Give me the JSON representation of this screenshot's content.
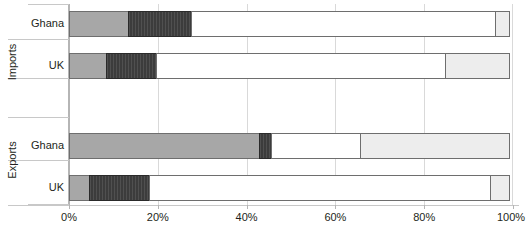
{
  "chart_data": {
    "type": "bar",
    "orientation": "horizontal",
    "stacked": true,
    "normalized": true,
    "title": "",
    "subtitle": "",
    "xlabel": "",
    "ylabel": "",
    "xlim": [
      0,
      100
    ],
    "x_tick_labels": [
      "0%",
      "20%",
      "40%",
      "60%",
      "80%",
      "100%"
    ],
    "x_ticks": [
      0,
      20,
      40,
      60,
      80,
      100
    ],
    "grid": true,
    "legend": false,
    "legend_position": "none",
    "group_labels": [
      "Imports",
      "Exports"
    ],
    "categories": [
      "Ghana",
      "UK",
      "Ghana",
      "UK"
    ],
    "groups": [
      {
        "name": "Imports",
        "rows": [
          {
            "label": "Ghana",
            "values": [
              13.5,
              14.4,
              68.7,
              3.4
            ]
          },
          {
            "label": "UK",
            "values": [
              8.6,
              11.5,
              65.3,
              14.6
            ]
          }
        ]
      },
      {
        "name": "Exports",
        "rows": [
          {
            "label": "Ghana",
            "values": [
              43.0,
              2.9,
              20.3,
              33.8
            ]
          },
          {
            "label": "UK",
            "values": [
              4.7,
              13.7,
              77.0,
              4.5
            ]
          }
        ]
      }
    ],
    "series": [
      {
        "name": "segment-1",
        "color": "#a7a7a7",
        "values": [
          13.5,
          8.6,
          43.0,
          4.7
        ]
      },
      {
        "name": "segment-2",
        "color": "#3c3c3c",
        "values": [
          14.4,
          11.5,
          2.9,
          13.7
        ]
      },
      {
        "name": "segment-3",
        "color": "#ffffff",
        "values": [
          68.7,
          65.3,
          20.3,
          77.0
        ]
      },
      {
        "name": "segment-4",
        "color": "#ededed",
        "values": [
          3.4,
          14.6,
          33.8,
          4.5
        ]
      }
    ],
    "colors": {
      "segment_1": "#a7a7a7",
      "segment_2": "#3c3c3c",
      "segment_3": "#ffffff",
      "segment_4": "#ededed",
      "segment_border": "#6e6e6e",
      "gridline": "#d9d9d9",
      "axis": "#b5b5b5",
      "text": "#231f20"
    }
  },
  "layout": {
    "bar_tops": [
      11,
      53,
      133,
      175
    ],
    "group_label_centers": [
      62,
      160
    ],
    "group_tick_tops": [
      4,
      39,
      78,
      117,
      160,
      205
    ]
  }
}
